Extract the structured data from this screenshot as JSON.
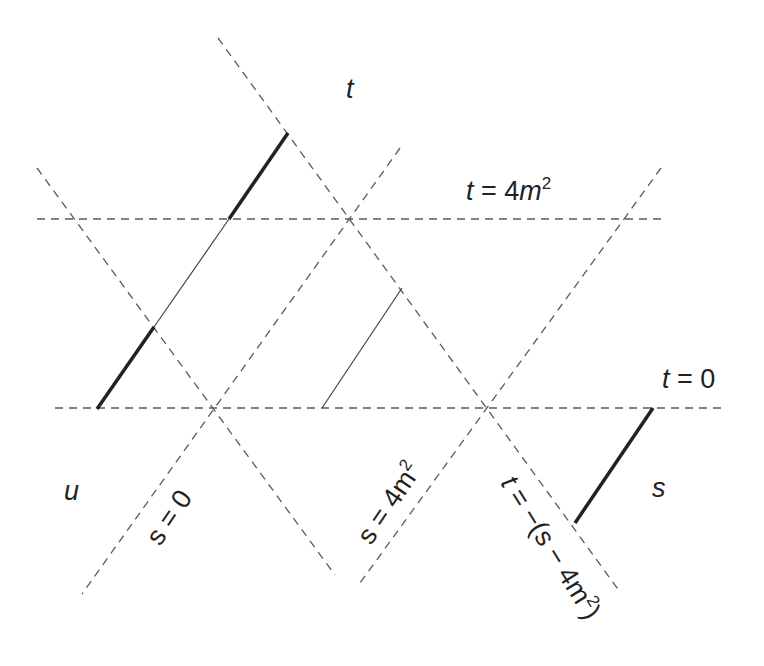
{
  "diagram": {
    "region_labels": {
      "t": "t",
      "u": "u",
      "s": "s"
    },
    "line_labels": {
      "t_top": "t = 4m²",
      "t_zero": "t = 0",
      "s_zero": "s = 0",
      "s_threshold": "s = 4m²",
      "t_diag": "t = −(s − 4m²)"
    },
    "dashed_lines": [
      {
        "name": "t-equals-4m2-line",
        "x1": 37,
        "y1": 219,
        "x2": 661,
        "y2": 219
      },
      {
        "name": "t-equals-0-line",
        "x1": 55,
        "y1": 408,
        "x2": 727,
        "y2": 408
      },
      {
        "name": "u-boundary-upper-line",
        "x1": 218,
        "y1": 38,
        "x2": 620,
        "y2": 592
      },
      {
        "name": "s-equals-0-line",
        "x1": 400,
        "y1": 148,
        "x2": 82,
        "y2": 594
      },
      {
        "name": "u-boundary-lower-line",
        "x1": 37,
        "y1": 168,
        "x2": 335,
        "y2": 575
      },
      {
        "name": "s-equals-4m2-line",
        "x1": 661,
        "y1": 168,
        "x2": 360,
        "y2": 583
      }
    ],
    "solid_segments": [
      {
        "name": "u-channel-cut-thick-lower",
        "style": "thick",
        "x1": 97,
        "y1": 409,
        "x2": 154,
        "y2": 327
      },
      {
        "name": "u-channel-cut-thin",
        "style": "thin",
        "x1": 154,
        "y1": 327,
        "x2": 229,
        "y2": 219
      },
      {
        "name": "t-channel-cut-thick",
        "style": "thick",
        "x1": 229,
        "y1": 219,
        "x2": 288,
        "y2": 133
      },
      {
        "name": "interior-thin-segment",
        "style": "thin",
        "x1": 322,
        "y1": 408,
        "x2": 402,
        "y2": 288
      },
      {
        "name": "s-channel-cut-thick",
        "style": "thick",
        "x1": 575,
        "y1": 523,
        "x2": 653,
        "y2": 408
      }
    ]
  }
}
